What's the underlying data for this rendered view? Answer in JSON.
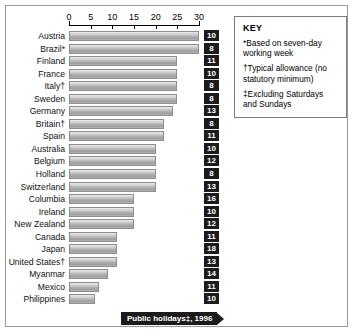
{
  "chart_data": {
    "type": "bar",
    "orientation": "horizontal",
    "title": "Public holidays‡, 1996",
    "xlabel": "",
    "ylabel": "",
    "xlim": [
      0,
      30
    ],
    "ticks": [
      0,
      5,
      10,
      15,
      20,
      25,
      30
    ],
    "grid": false,
    "categories": [
      "Austria",
      "Brazil*",
      "Finland",
      "France",
      "Italy†",
      "Sweden",
      "Germany",
      "Britain†",
      "Spain",
      "Australia",
      "Belgium",
      "Holland",
      "Switzerland",
      "Columbia",
      "Ireland",
      "New Zealand",
      "Canada",
      "Japan",
      "United States†",
      "Myanmar",
      "Mexico",
      "Philippines"
    ],
    "series": [
      {
        "name": "Paid holiday entitlement (days)",
        "values": [
          30,
          30,
          25,
          25,
          25,
          25,
          24,
          22,
          22,
          20,
          20,
          20,
          20,
          15,
          15,
          15,
          11,
          11,
          11,
          9,
          7,
          6
        ]
      },
      {
        "name": "Public holidays",
        "values": [
          10,
          8,
          11,
          10,
          8,
          8,
          13,
          8,
          11,
          10,
          12,
          8,
          13,
          16,
          10,
          12,
          11,
          18,
          13,
          14,
          11,
          10
        ]
      }
    ]
  },
  "key": {
    "title": "KEY",
    "notes": [
      "*Based on seven-day working week",
      "†Typical allowance (no statutory minimum)",
      "‡Excluding Saturdays and Sundays"
    ]
  },
  "colors": {
    "badge_background": "#1b1b1b",
    "badge_text": "#ffffff",
    "bar_border": "#8d8d8d",
    "frame": "#9a9a9a",
    "background": "#ffffff"
  }
}
